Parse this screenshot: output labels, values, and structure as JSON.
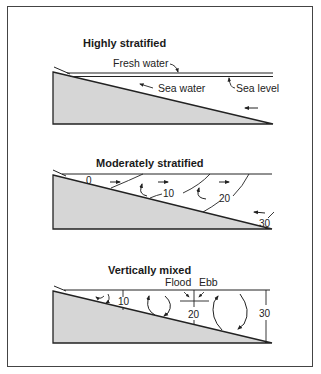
{
  "figure": {
    "panels": [
      {
        "title": "Highly stratified",
        "labels": {
          "fresh_water": "Fresh water",
          "sea_water": "Sea water",
          "sea_level": "Sea level"
        }
      },
      {
        "title": "Moderately stratified",
        "isohalines": [
          "0",
          "10",
          "20",
          "30"
        ]
      },
      {
        "title": "Vertically mixed",
        "isohalines": [
          "10",
          "20",
          "30"
        ],
        "labels": {
          "flood": "Flood",
          "ebb": "Ebb"
        }
      }
    ],
    "colors": {
      "land_fill": "#d6d6d6",
      "line": "#222222",
      "frame": "#444444"
    }
  }
}
